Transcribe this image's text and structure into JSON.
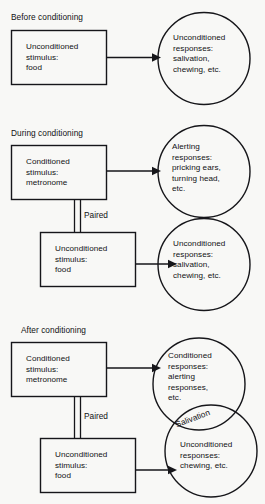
{
  "figure": {
    "type": "diagram",
    "background_color": "#f8f8f6",
    "line_color": "#16161a"
  },
  "sections": [
    {
      "id": "before",
      "label": "Before conditioning",
      "box": {
        "name": "unconditioned-stimulus",
        "lines": "Unconditioned\nstimulus:\nfood"
      },
      "circles": [
        {
          "name": "unconditioned-responses",
          "lines": "Unconditioned\nresponses:\nsalivation,\nchewing, etc."
        }
      ],
      "connectors": [
        {
          "name": "us-to-ur-arrow",
          "label": ""
        }
      ]
    },
    {
      "id": "during",
      "label": "During conditioning",
      "box_top": {
        "name": "conditioned-stimulus",
        "lines": "Conditioned\nstimulus:\nmetronome"
      },
      "box_bottom": {
        "name": "unconditioned-stimulus",
        "lines": "Unconditioned\nstimulus:\nfood"
      },
      "circle_top": {
        "name": "alerting-responses",
        "lines": "Alerting\nresponses:\npricking ears,\nturning head,\netc."
      },
      "circle_bottom": {
        "name": "unconditioned-responses",
        "lines": "Unconditioned\nresponses:\nsalivation,\nchewing, etc."
      },
      "paired_label": "Paired"
    },
    {
      "id": "after",
      "label": "After conditioning",
      "box_top": {
        "name": "conditioned-stimulus",
        "lines": "Conditioned\nstimulus:\nmetronome"
      },
      "box_bottom": {
        "name": "unconditioned-stimulus",
        "lines": "Unconditioned\nstimulus:\nfood"
      },
      "circle_top": {
        "name": "conditioned-responses",
        "lines": "Conditioned\nresponses:\nalerting\nresponses,\netc."
      },
      "circle_bottom": {
        "name": "unconditioned-responses",
        "lines": "Unconditioned\nresponses:\nchewing, etc."
      },
      "overlap_label": "Salivation",
      "paired_label": "Paired"
    }
  ]
}
